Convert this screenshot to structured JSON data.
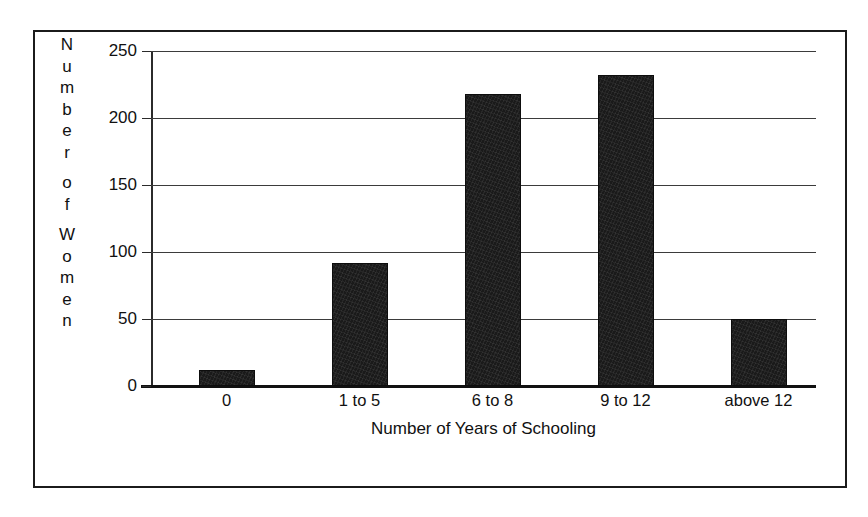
{
  "chart_data": {
    "type": "bar",
    "title": "",
    "subtitle": "",
    "xlabel": "Number of Years of Schooling",
    "ylabel": "Number of Women",
    "ylabel_letters": [
      "N",
      "u",
      "m",
      "b",
      "e",
      "r",
      "",
      "o",
      "f",
      "",
      "W",
      "o",
      "m",
      "e",
      "n"
    ],
    "categories": [
      "0",
      "1 to 5",
      "6 to 8",
      "9 to 12",
      "above 12"
    ],
    "values": [
      12,
      92,
      218,
      232,
      50
    ],
    "ylim": [
      0,
      250
    ],
    "yticks": [
      0,
      50,
      100,
      150,
      200,
      250
    ],
    "ytick_labels": [
      "0",
      "50",
      "100",
      "150",
      "200",
      "250"
    ],
    "grid": true,
    "grid_axis": "y",
    "legend": false,
    "legend_position": "none",
    "bar_color": "#1a1a1a",
    "axis_color": "#111111",
    "frame_color": "#1b1b1b",
    "background": "#ffffff"
  }
}
